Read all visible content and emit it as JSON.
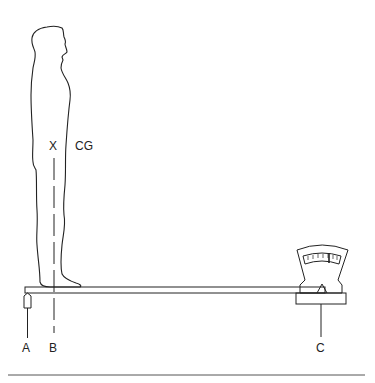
{
  "diagram": {
    "labels": {
      "cg_mark": "X",
      "cg": "CG",
      "point_a": "A",
      "point_b": "B",
      "point_c": "C"
    },
    "elements": [
      "standing-person",
      "reaction-board",
      "knife-edge-support",
      "weighing-scale",
      "cg-plumb-line",
      "bottom-rule"
    ],
    "colors": {
      "stroke": "#222222",
      "background": "#ffffff"
    }
  }
}
